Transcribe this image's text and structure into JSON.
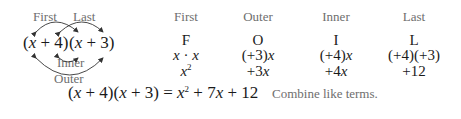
{
  "diagram": {
    "left": {
      "top_labels": [
        "First",
        "Last"
      ],
      "expression": {
        "factor1": "(x + 4)",
        "factor2": "(x + 3)"
      },
      "bottom_labels": [
        "Inner",
        "Outer"
      ]
    },
    "columns": [
      {
        "header": "First",
        "letter": "F",
        "product": "x · x",
        "result": "x²"
      },
      {
        "header": "Outer",
        "letter": "O",
        "product": "(+3)x",
        "result": "+3x"
      },
      {
        "header": "Inner",
        "letter": "I",
        "product": "(+4)x",
        "result": "+4x"
      },
      {
        "header": "Last",
        "letter": "L",
        "product": "(+4)(+3)",
        "result": "+12"
      }
    ],
    "final": {
      "lhs": "(x + 4)(x + 3)",
      "equals": "=",
      "rhs": "x² + 7x + 12",
      "note": "Combine like terms."
    },
    "colors": {
      "text": "#1a1a1a",
      "label": "#6e6e6e",
      "arrow": "#333333"
    }
  }
}
